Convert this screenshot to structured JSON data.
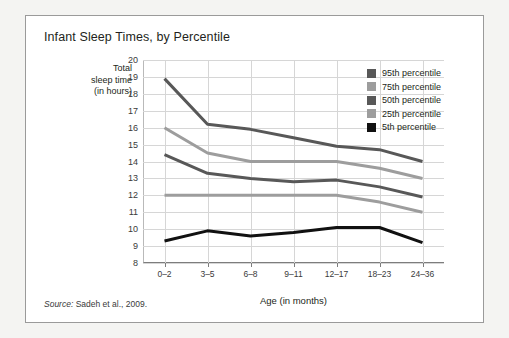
{
  "chart_title": "Infant Sleep Times, by Percentile",
  "source_note": {
    "prefix": "Source:",
    "text": "Sadeh et al., 2009."
  },
  "axis": {
    "y_title_lines": [
      "Total",
      "sleep time",
      "(in hours)"
    ],
    "x_title": "Age (in months)"
  },
  "legend": {
    "items": [
      {
        "label": "95th percentile",
        "color": "#585858"
      },
      {
        "label": "75th percentile",
        "color": "#9d9d9d"
      },
      {
        "label": "50th percentile",
        "color": "#585858"
      },
      {
        "label": "25th percentile",
        "color": "#9d9d9d"
      },
      {
        "label": "5th percentile",
        "color": "#111111"
      }
    ]
  },
  "chart_data": {
    "type": "line",
    "title": "Infant Sleep Times, by Percentile",
    "xlabel": "Age (in months)",
    "ylabel": "Total sleep time (in hours)",
    "categories": [
      "0–2",
      "3–5",
      "6–8",
      "9–11",
      "12–17",
      "18–23",
      "24–36"
    ],
    "ylim": [
      8,
      20
    ],
    "ytick_step": 1,
    "yticks": [
      20,
      19,
      18,
      17,
      16,
      15,
      14,
      13,
      12,
      11,
      10,
      9,
      8
    ],
    "grid": true,
    "legend_position": "top-right inside plot",
    "series": [
      {
        "name": "95th percentile",
        "color": "#585858",
        "values": [
          18.9,
          16.2,
          15.9,
          15.4,
          14.9,
          14.7,
          14.0
        ]
      },
      {
        "name": "75th percentile",
        "color": "#9d9d9d",
        "values": [
          16.0,
          14.5,
          14.0,
          14.0,
          14.0,
          13.6,
          13.0
        ]
      },
      {
        "name": "50th percentile",
        "color": "#585858",
        "values": [
          14.4,
          13.3,
          13.0,
          12.8,
          12.9,
          12.5,
          11.9
        ]
      },
      {
        "name": "25th percentile",
        "color": "#9d9d9d",
        "values": [
          12.0,
          12.0,
          12.0,
          12.0,
          12.0,
          11.6,
          11.0
        ]
      },
      {
        "name": "5th percentile",
        "color": "#111111",
        "values": [
          9.3,
          9.9,
          9.6,
          9.8,
          10.1,
          10.1,
          9.2
        ]
      }
    ]
  }
}
